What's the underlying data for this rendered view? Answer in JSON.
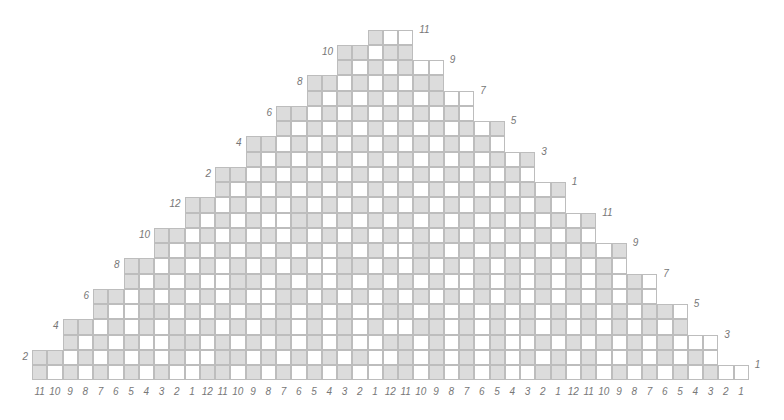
{
  "chart": {
    "title": "",
    "colors": {
      "shaded": "#dcdcdc",
      "blank": "#ffffff",
      "grid": "#bdbdbd",
      "label": "#777777"
    },
    "geometry": {
      "rows": 23,
      "bottom_cols": 47,
      "cell": 15.25,
      "origin_x": 32,
      "bottom_y": 365
    },
    "left_labels": [
      {
        "row": 1,
        "text": "2"
      },
      {
        "row": 3,
        "text": "4"
      },
      {
        "row": 5,
        "text": "6"
      },
      {
        "row": 7,
        "text": "8"
      },
      {
        "row": 9,
        "text": "10"
      },
      {
        "row": 11,
        "text": "12"
      },
      {
        "row": 13,
        "text": "2"
      },
      {
        "row": 15,
        "text": "4"
      },
      {
        "row": 17,
        "text": "6"
      },
      {
        "row": 19,
        "text": "8"
      },
      {
        "row": 21,
        "text": "10"
      }
    ],
    "right_labels": [
      {
        "row": 0,
        "text": "1"
      },
      {
        "row": 2,
        "text": "3"
      },
      {
        "row": 4,
        "text": "5"
      },
      {
        "row": 6,
        "text": "7"
      },
      {
        "row": 8,
        "text": "9"
      },
      {
        "row": 10,
        "text": "11"
      },
      {
        "row": 12,
        "text": "1"
      },
      {
        "row": 14,
        "text": "3"
      },
      {
        "row": 16,
        "text": "5"
      },
      {
        "row": 18,
        "text": "7"
      },
      {
        "row": 20,
        "text": "9"
      },
      {
        "row": 22,
        "text": "11"
      }
    ],
    "bottom_labels": [
      "11",
      "10",
      "9",
      "8",
      "7",
      "6",
      "5",
      "4",
      "3",
      "2",
      "1",
      "12",
      "11",
      "10",
      "9",
      "8",
      "7",
      "6",
      "5",
      "4",
      "3",
      "2",
      "1",
      "12",
      "11",
      "10",
      "9",
      "8",
      "7",
      "6",
      "5",
      "4",
      "3",
      "2",
      "1",
      "12",
      "11",
      "10",
      "9",
      "8",
      "7",
      "6",
      "5",
      "4",
      "3",
      "2",
      "1"
    ],
    "rows_from_bottom": [
      "GWGWGWGWGWWGGWGWGWGWGWWGGWGWGWGWWGGWGWGWGWGWGWW",
      "GGWGWGWGWGWWGGWGWGWGWGWWGWGWGWGWGWGWGWWGWGWGW",
      "GWGWGWWGGWGWGWGWGWGWWGGWGWGWGWWGWGWGWGWGWWW",
      "GGWGWGWGWGWGWGGWGWGWGWWGGWGWGWGWGWGWGWGWGWG",
      "GWWGGWGWGWGWGWGWGWWGGWGWGWGWGWGWGWGWGGWGW",
      "GGWGWGWGWGWWGGWGWGWGWGWGWGWGWGWGWGWGWGW",
      "GWGWGWWGGWGWGWGWGWGWGWWGWGWGWGWGWGWGW",
      "GGWGWGWGWGWGWWGGWGWGWGWGWGWGWGWGWWG",
      "GWGWGWGWGWGWGWGWWGGWGWGWGWGWGWGWW",
      "GGWGWGWGWGWGWGWGWGWGWGWGWGWGWWG",
      "GWGWGWWGGWGWGWGWGWGWGWGWGWGWW",
      "GGWGWGWGWGWGWGWGWGWGWGWGWGG",
      "GWGWGWGWGWGWGWGWGWGWGWGWW",
      "GGWGWGWGWGWGWGWGWGWGWGG",
      "GWGWGWGWGWGWGWGWGWGWW",
      "GGWGWGWGWGWGWGWGWGG",
      "GWGWGWGWGWGWGWGWW",
      "GGWGWGWGWGWGWWG",
      "GWGWGWGWGWW",
      "GGWGWGWGG",
      "GWGWGWW",
      "GGWGG",
      "GWW"
    ]
  }
}
